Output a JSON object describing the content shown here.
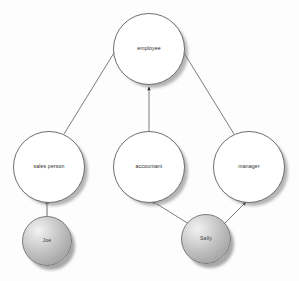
{
  "diagram": {
    "background_color": "#fdfdfd",
    "nodes": [
      {
        "id": "employee",
        "label": "employee",
        "kind": "class",
        "cx": 149,
        "cy": 49,
        "r": 36,
        "fill": "#ffffff",
        "stroke": "#6e6e6e"
      },
      {
        "id": "sales-person",
        "label": "sales person",
        "kind": "class",
        "cx": 49,
        "cy": 167,
        "r": 36,
        "fill": "#ffffff",
        "stroke": "#6e6e6e"
      },
      {
        "id": "accountant",
        "label": "accountant",
        "kind": "class",
        "cx": 149,
        "cy": 167,
        "r": 36,
        "fill": "#ffffff",
        "stroke": "#6e6e6e"
      },
      {
        "id": "manager",
        "label": "manager",
        "kind": "class",
        "cx": 249,
        "cy": 167,
        "r": 36,
        "fill": "#ffffff",
        "stroke": "#6e6e6e"
      },
      {
        "id": "joe",
        "label": "Joe",
        "kind": "instance",
        "cx": 47,
        "cy": 241,
        "r": 25,
        "fill": "#bdbdbd",
        "stroke": "#7a7a7a"
      },
      {
        "id": "sally",
        "label": "Sally",
        "kind": "instance",
        "cx": 206,
        "cy": 239,
        "r": 25,
        "fill": "#bdbdbd",
        "stroke": "#7a7a7a"
      }
    ],
    "edges": [
      {
        "id": "sales-person-to-employee",
        "from": "sales person",
        "to": "employee",
        "arrowhead": "solid",
        "x1": 64,
        "y1": 134,
        "x2": 117,
        "y2": 48
      },
      {
        "id": "accountant-to-employee",
        "from": "accountant",
        "to": "employee",
        "arrowhead": "solid",
        "x1": 149,
        "y1": 131,
        "x2": 149,
        "y2": 87
      },
      {
        "id": "manager-to-employee",
        "from": "manager",
        "to": "employee",
        "arrowhead": "solid",
        "x1": 234,
        "y1": 134,
        "x2": 181,
        "y2": 48
      },
      {
        "id": "joe-to-sales-person",
        "from": "Joe",
        "to": "sales person",
        "arrowhead": "solid",
        "x1": 47,
        "y1": 217,
        "x2": 47,
        "y2": 200
      },
      {
        "id": "sally-to-accountant",
        "from": "Sally",
        "to": "accountant",
        "arrowhead": "solid",
        "x1": 189,
        "y1": 224,
        "x2": 152,
        "y2": 201
      },
      {
        "id": "sally-to-manager",
        "from": "Sally",
        "to": "manager",
        "arrowhead": "solid",
        "x1": 224,
        "y1": 224,
        "x2": 246,
        "y2": 202
      }
    ],
    "edge_style": {
      "stroke": "#5a5a5a",
      "stroke_width": 0.8,
      "arrow_fill": "#1a1a1a"
    }
  }
}
